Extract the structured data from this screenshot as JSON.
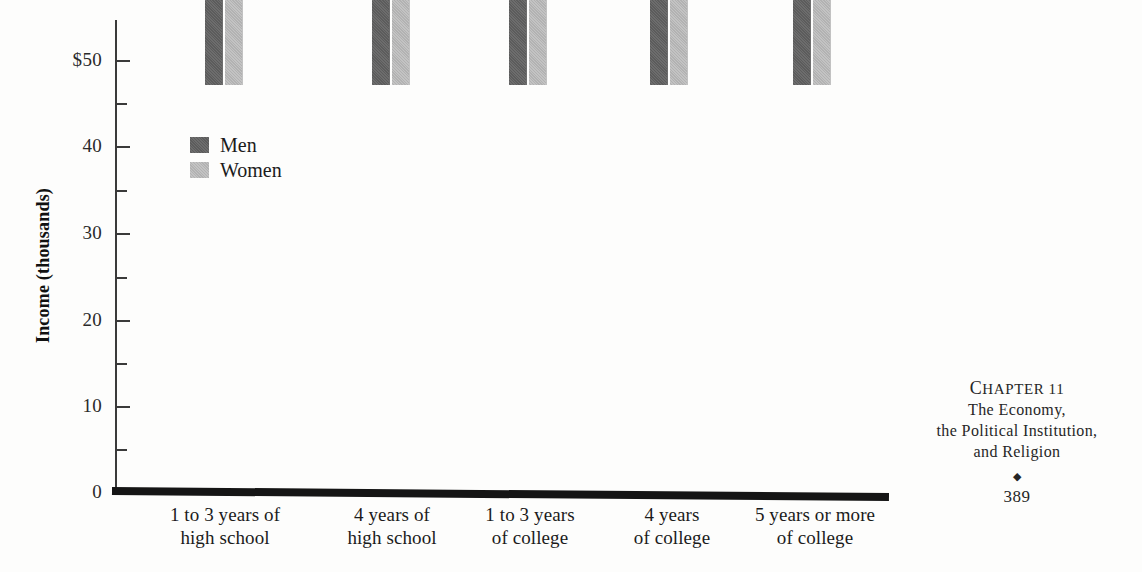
{
  "chart_data": {
    "type": "bar",
    "title": "",
    "xlabel": "",
    "ylabel": "Income (thousands)",
    "ylim": [
      0,
      50
    ],
    "yticks": [
      0,
      10,
      20,
      30,
      40,
      50
    ],
    "ytick_labels": [
      "0",
      "10",
      "20",
      "30",
      "40",
      "$50"
    ],
    "minor_yticks": [
      5,
      15,
      25,
      35,
      45
    ],
    "grid": false,
    "legend_position": "upper-left-inside",
    "categories": [
      "1 to 3 years of high school",
      "4 years of high school",
      "1 to 3 years of college",
      "4 years of college",
      "5 years or more of college"
    ],
    "category_lines": [
      [
        "1 to 3 years of",
        "high school"
      ],
      [
        "4 years of",
        "high school"
      ],
      [
        "1 to 3 years",
        "of college"
      ],
      [
        "4 years",
        "of college"
      ],
      [
        "5 years or more",
        "of college"
      ]
    ],
    "series": [
      {
        "name": "Men",
        "color": "#5c5c5c",
        "values": [
          21.1,
          25.6,
          29.8,
          36.0,
          42.7
        ]
      },
      {
        "name": "Women",
        "color": "#b2b2b2",
        "values": [
          14.2,
          16.9,
          20.8,
          24.2,
          30.9
        ]
      }
    ]
  },
  "legend": {
    "items": [
      {
        "label": "Men"
      },
      {
        "label": "Women"
      }
    ]
  },
  "folio": {
    "chapter_drop": "C",
    "chapter_rest": "HAPTER 11",
    "title_line_1": "The Economy,",
    "title_line_2": "the Political Institution,",
    "title_line_3": "and Religion",
    "ornament": "◆",
    "page_number": "389"
  }
}
